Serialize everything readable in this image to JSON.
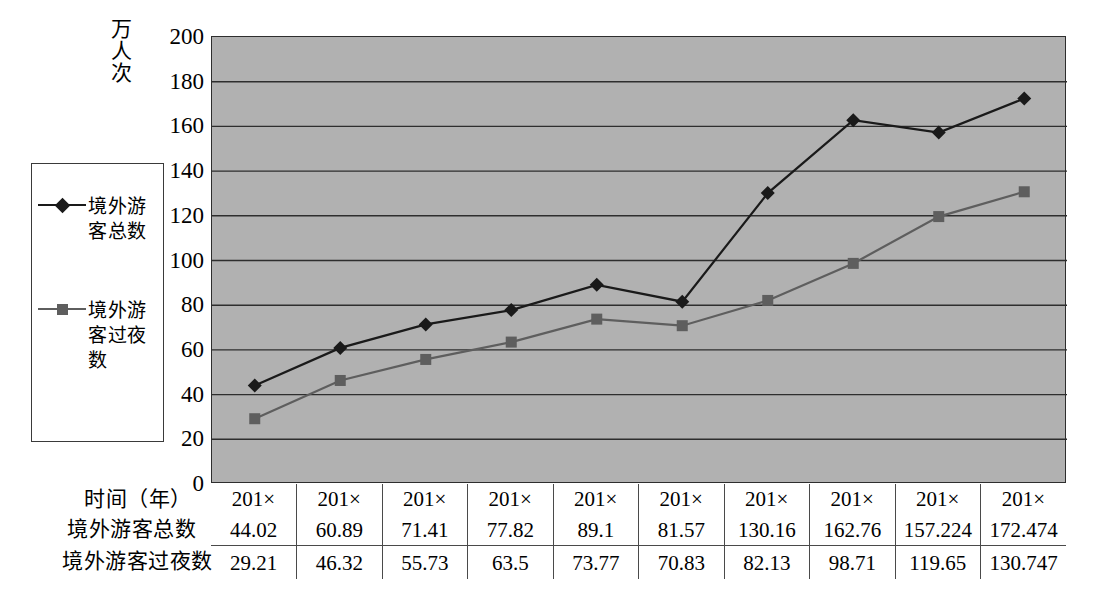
{
  "chart_data": {
    "type": "line",
    "title": "",
    "ylabel": "万人次",
    "xlabel": "时间（年）",
    "ylim": [
      0,
      200
    ],
    "ytick_step": 20,
    "grid": true,
    "legend_position": "left-outside",
    "categories": [
      "201×",
      "201×",
      "201×",
      "201×",
      "201×",
      "201×",
      "201×",
      "201×",
      "201×",
      "201×"
    ],
    "yticks": [
      "200",
      "180",
      "160",
      "140",
      "120",
      "100",
      "80",
      "60",
      "40",
      "20",
      "0"
    ],
    "series": [
      {
        "name": "境外游客总数",
        "marker": "diamond",
        "color": "#1a1a1a",
        "values": [
          44.02,
          60.89,
          71.41,
          77.82,
          89.1,
          81.57,
          130.16,
          162.76,
          157.224,
          172.474
        ]
      },
      {
        "name": "境外游客过夜数",
        "marker": "square",
        "color": "#5e5e5e",
        "values": [
          29.21,
          46.32,
          55.73,
          63.5,
          73.77,
          70.83,
          82.13,
          98.71,
          119.65,
          130.747
        ]
      }
    ],
    "plot_bg_color": "#b1b1b1",
    "gridline_color": "#2e2e2e"
  },
  "legend": {
    "entries": [
      {
        "label": "境外游客总数",
        "marker": "diamond",
        "color": "#1a1a1a"
      },
      {
        "label": "境外游客过夜数",
        "marker": "square",
        "color": "#5e5e5e"
      }
    ]
  },
  "table": {
    "row_labels": [
      "时间（年）",
      "境外游客总数",
      "境外游客过夜数"
    ],
    "rows": [
      [
        "201×",
        "201×",
        "201×",
        "201×",
        "201×",
        "201×",
        "201×",
        "201×",
        "201×",
        "201×"
      ],
      [
        "44.02",
        "60.89",
        "71.41",
        "77.82",
        "89.1",
        "81.57",
        "130.16",
        "162.76",
        "157.224",
        "172.474"
      ],
      [
        "29.21",
        "46.32",
        "55.73",
        "63.5",
        "73.77",
        "70.83",
        "82.13",
        "98.71",
        "119.65",
        "130.747"
      ]
    ]
  }
}
